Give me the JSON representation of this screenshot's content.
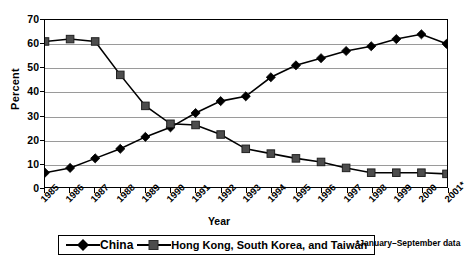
{
  "chart_data": {
    "type": "line",
    "title": "",
    "xlabel": "Year",
    "ylabel": "Percent",
    "ylim": [
      0,
      70
    ],
    "ytick_labels": [
      "0",
      "10",
      "20",
      "30",
      "40",
      "50",
      "60",
      "70"
    ],
    "ytick_values": [
      0,
      10,
      20,
      30,
      40,
      50,
      60,
      70
    ],
    "grid": true,
    "legend_position": "bottom",
    "categories": [
      "1985",
      "1986",
      "1987",
      "1988",
      "1989",
      "1990",
      "1991",
      "1992",
      "1993",
      "1994",
      "1995",
      "1996",
      "1997",
      "1998",
      "1999",
      "2000",
      "2001*"
    ],
    "series": [
      {
        "name": "China",
        "marker": "diamond",
        "color": "#000000",
        "values": [
          6,
          8,
          12,
          16,
          21,
          25,
          31,
          36,
          38,
          46,
          51,
          54,
          57,
          59,
          62,
          64,
          60
        ]
      },
      {
        "name": "Hong Kong, South Korea, and Taiwan",
        "marker": "square",
        "color": "#4d4d4d",
        "values": [
          61,
          62,
          61,
          47,
          34,
          26.5,
          26,
          22,
          16,
          14,
          12,
          10.5,
          8,
          6,
          6,
          6,
          5.5
        ]
      }
    ],
    "annotations": [
      "*January–September data"
    ]
  },
  "legend": {
    "china_label": "China",
    "hkskt_label": "Hong Kong, South Korea, and Taiwan"
  },
  "footnote": "*January–September data",
  "axes": {
    "x_title": "Year",
    "y_title": "Percent"
  },
  "colors": {
    "china": "#000000",
    "hkskt": "#4d4d4d",
    "grid": "#9a9a9a",
    "frame": "#000000",
    "background": "#ffffff"
  }
}
